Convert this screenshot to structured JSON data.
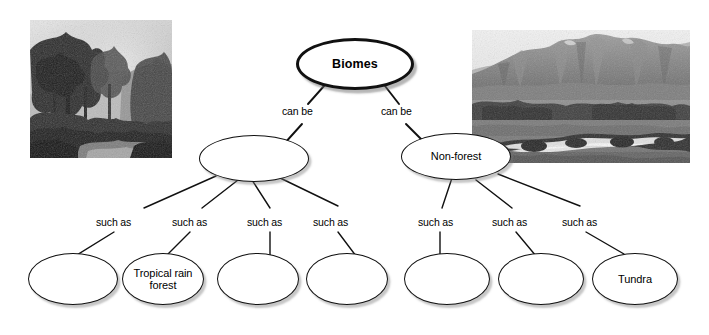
{
  "diagram": {
    "background_color": "#ffffff",
    "line_color": "#111111",
    "text_color": "#000000"
  },
  "root": {
    "label": "Biomes"
  },
  "middle": [
    {
      "label": "",
      "edge_label": "can be"
    },
    {
      "label": "Non-forest",
      "edge_label": "can be"
    }
  ],
  "leaves_left": [
    {
      "label": "",
      "edge_label": "such as"
    },
    {
      "label": "Tropical rain forest",
      "edge_label": "such as"
    },
    {
      "label": "",
      "edge_label": "such as"
    },
    {
      "label": "",
      "edge_label": "such as"
    }
  ],
  "leaves_right": [
    {
      "label": "",
      "edge_label": "such as"
    },
    {
      "label": "",
      "edge_label": "such as"
    },
    {
      "label": "Tundra",
      "edge_label": "such as"
    }
  ],
  "photos": {
    "left": {
      "name": "rainforest-photo",
      "alt": "Misty tropical rainforest canopy"
    },
    "right": {
      "name": "tundra-photo",
      "alt": "Tundra landscape with mountains and stream"
    }
  }
}
